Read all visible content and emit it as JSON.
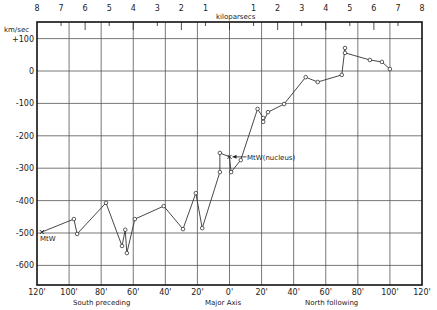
{
  "chart_data": {
    "type": "line",
    "title": "",
    "ylabel": "km/sec",
    "xlabel": "Major Axis",
    "x_sublabels": {
      "left": "South preceding",
      "right": "North following"
    },
    "top_axis": {
      "label": "kiloparsecs",
      "ticks": [
        "8",
        "7",
        "6",
        "5",
        "4",
        "3",
        "2",
        "1",
        "1",
        "2",
        "3",
        "4",
        "5",
        "6",
        "7",
        "8"
      ],
      "range_kpc": [
        -8,
        8
      ]
    },
    "xlim": [
      -120,
      120
    ],
    "ylim": [
      -650,
      110
    ],
    "x_ticks": [
      -120,
      -100,
      -80,
      -60,
      -40,
      -20,
      0,
      20,
      40,
      60,
      80,
      100,
      120
    ],
    "x_tick_labels": [
      "120'",
      "100'",
      "80'",
      "60'",
      "40'",
      "20'",
      "0'",
      "20'",
      "40'",
      "60'",
      "80'",
      "100'",
      "120'"
    ],
    "y_ticks": [
      100,
      0,
      -100,
      -200,
      -300,
      -400,
      -500,
      -600
    ],
    "y_tick_labels": [
      "+100",
      "0",
      "-100",
      "-200",
      "-300",
      "-400",
      "-500",
      "-600"
    ],
    "grid": true,
    "annotations": [
      {
        "text": "MtW",
        "x": -117,
        "y": -497
      },
      {
        "text": "MtW(nucleus)",
        "x": 0,
        "y": -265
      }
    ],
    "series": [
      {
        "name": "radial velocity",
        "points": [
          [
            -117,
            -497
          ],
          [
            -97,
            -457
          ],
          [
            -95,
            -503
          ],
          [
            -77,
            -407
          ],
          [
            -67,
            -540
          ],
          [
            -65,
            -490
          ],
          [
            -64,
            -562
          ],
          [
            -59,
            -457
          ],
          [
            -41,
            -417
          ],
          [
            -29,
            -488
          ],
          [
            -21,
            -377
          ],
          [
            -17,
            -485
          ],
          [
            -6,
            -312
          ],
          [
            -6,
            -253
          ],
          [
            0,
            -265
          ],
          [
            1,
            -312
          ],
          [
            7,
            -275
          ],
          [
            17.5,
            -117
          ],
          [
            21,
            -145
          ],
          [
            21,
            -157
          ],
          [
            24,
            -127
          ],
          [
            34,
            -102
          ],
          [
            47.5,
            -19
          ],
          [
            55,
            -34
          ],
          [
            70,
            -12
          ],
          [
            72,
            71
          ],
          [
            72,
            56
          ],
          [
            87.5,
            34
          ],
          [
            95,
            28
          ],
          [
            100,
            6
          ]
        ]
      }
    ]
  },
  "labels": {
    "y_unit": "km/sec",
    "kpc": "kiloparsecs",
    "south": "South preceding",
    "major": "Major Axis",
    "north": "North following",
    "mtw": "MtW",
    "nucleus": "MtW(nucleus)"
  },
  "colors": {
    "ink": "#222222",
    "grid": "#555555",
    "background": "#ffffff"
  }
}
